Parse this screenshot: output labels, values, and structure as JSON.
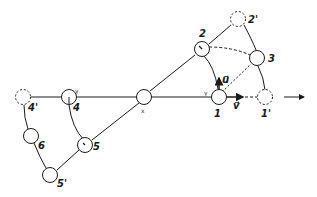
{
  "diagram": {
    "type": "kinematic linkage / node displacement diagram",
    "colors": {
      "stroke": "#1a1a1a",
      "background": "#ffffff"
    },
    "nodes": [
      {
        "id": "1",
        "label": "1",
        "x": 219,
        "y": 97,
        "style": "solid"
      },
      {
        "id": "1p",
        "label": "1'",
        "x": 265,
        "y": 97,
        "style": "dashed"
      },
      {
        "id": "2",
        "label": "2",
        "x": 202,
        "y": 49,
        "style": "solid"
      },
      {
        "id": "2p",
        "label": "2'",
        "x": 238,
        "y": 19,
        "style": "dashed"
      },
      {
        "id": "3",
        "label": "3",
        "x": 257,
        "y": 58,
        "style": "solid"
      },
      {
        "id": "4",
        "label": "4",
        "x": 69,
        "y": 97,
        "style": "solid"
      },
      {
        "id": "4p",
        "label": "4'",
        "x": 23,
        "y": 97,
        "style": "dashed"
      },
      {
        "id": "X",
        "label": "x",
        "x": 144,
        "y": 97,
        "style": "solid"
      },
      {
        "id": "5",
        "label": "5",
        "x": 85,
        "y": 145,
        "style": "solid"
      },
      {
        "id": "5p",
        "label": "5'",
        "x": 50,
        "y": 175,
        "style": "solid"
      },
      {
        "id": "6",
        "label": "6",
        "x": 31,
        "y": 136,
        "style": "solid"
      }
    ],
    "small_labels": {
      "gamma_4": "γ",
      "gamma_1": "γ",
      "x_label": "x"
    },
    "vectors": {
      "u": "u⃗",
      "v": "v⃗"
    },
    "direction_arrow": "→"
  }
}
